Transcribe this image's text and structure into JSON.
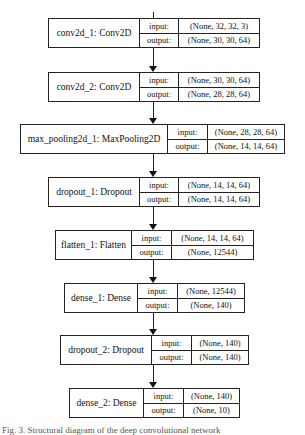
{
  "diagram": {
    "type": "keras-model-plot",
    "labels": {
      "input": "input:",
      "output": "output:"
    },
    "nodes": [
      {
        "name": "conv2d_1: Conv2D",
        "input": "(None, 32, 32, 3)",
        "output": "(None, 30, 30, 64)"
      },
      {
        "name": "conv2d_2: Conv2D",
        "input": "(None, 30, 30, 64)",
        "output": "(None, 28, 28, 64)"
      },
      {
        "name": "max_pooling2d_1: MaxPooling2D",
        "input": "(None, 28, 28, 64)",
        "output": "(None, 14, 14, 64)"
      },
      {
        "name": "dropout_1: Dropout",
        "input": "(None, 14, 14, 64)",
        "output": "(None, 14, 14, 64)"
      },
      {
        "name": "flatten_1: Flatten",
        "input": "(None, 14, 14, 64)",
        "output": "(None, 12544)"
      },
      {
        "name": "dense_1: Dense",
        "input": "(None, 12544)",
        "output": "(None, 140)"
      },
      {
        "name": "dropout_2: Dropout",
        "input": "(None, 140)",
        "output": "(None, 140)"
      },
      {
        "name": "dense_2: Dense",
        "input": "(None, 140)",
        "output": "(None, 10)"
      }
    ],
    "caption": "Fig. 3. Structural diagram of the deep convolutional network"
  }
}
